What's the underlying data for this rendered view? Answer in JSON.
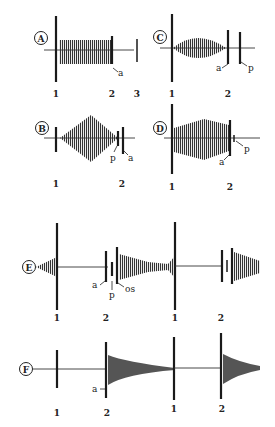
{
  "figure": {
    "panels": [
      {
        "id": "A",
        "label": "A",
        "markers": [
          "1",
          "2",
          "3"
        ],
        "annotations": [
          "a"
        ],
        "envelope": "rectangular"
      },
      {
        "id": "B",
        "label": "B",
        "markers": [
          "1",
          "2"
        ],
        "annotations": [
          "p",
          "a"
        ],
        "envelope": "diamond"
      },
      {
        "id": "C",
        "label": "C",
        "markers": [
          "1",
          "2"
        ],
        "annotations": [
          "a",
          "p"
        ],
        "envelope": "spindle"
      },
      {
        "id": "D",
        "label": "D",
        "markers": [
          "1",
          "2"
        ],
        "annotations": [
          "a",
          "p"
        ],
        "envelope": "crescendo-plateau"
      },
      {
        "id": "E",
        "label": "E",
        "markers": [
          "1",
          "2",
          "1",
          "2"
        ],
        "annotations": [
          "a",
          "p",
          "os"
        ],
        "envelope": "decrescendo-crescendo"
      },
      {
        "id": "F",
        "label": "F",
        "markers": [
          "1",
          "2",
          "1",
          "2"
        ],
        "annotations": [
          "a"
        ],
        "envelope": "decrescendo"
      }
    ],
    "colors": {
      "ink": "#1a1a1a",
      "fill": "#555555",
      "background": "#ffffff"
    }
  }
}
